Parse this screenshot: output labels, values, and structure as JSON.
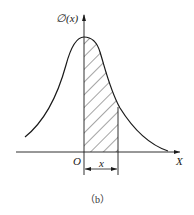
{
  "figure": {
    "y_axis_label": "∅(x)",
    "x_axis_label": "X",
    "origin_label": "O",
    "interval_label": "x",
    "caption": "（b）"
  },
  "colors": {
    "line": "#1a1a1a",
    "background": "#ffffff"
  }
}
